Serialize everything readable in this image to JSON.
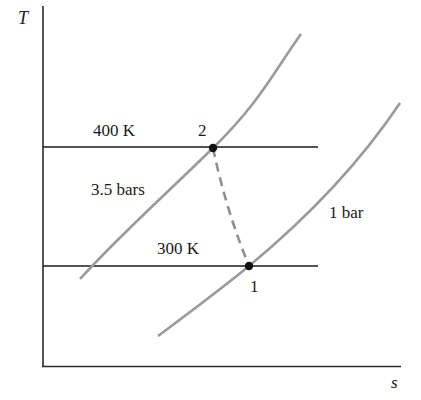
{
  "diagram": {
    "type": "T-s diagram",
    "axes": {
      "y_label": "T",
      "x_label": "s"
    },
    "isotherms": [
      {
        "label": "400 K",
        "y": 147
      },
      {
        "label": "300 K",
        "y": 266
      }
    ],
    "isobars": [
      {
        "label": "3.5 bars"
      },
      {
        "label": "1 bar"
      }
    ],
    "states": [
      {
        "label": "1",
        "description": "300 K, 1 bar"
      },
      {
        "label": "2",
        "description": "400 K, 3.5 bars"
      }
    ],
    "process": {
      "from": "1",
      "to": "2",
      "style": "dashed"
    },
    "colors": {
      "axis": "#2a2a2a",
      "isotherm": "#1a1a1a",
      "isobar": "#9a9a9a",
      "process": "#8f8f8f",
      "point": "#111111"
    }
  }
}
